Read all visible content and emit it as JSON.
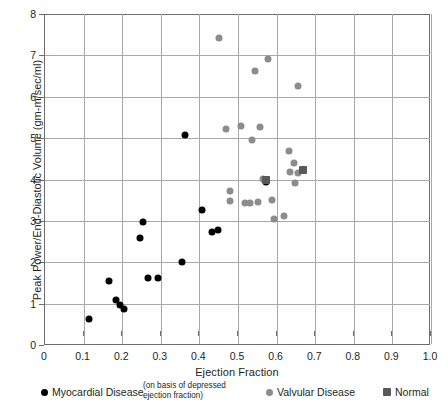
{
  "chart_data": {
    "type": "scatter",
    "title": "",
    "xlabel": "Ejection Fraction",
    "ylabel": "Peak Power/End-Diastolic Volume (gm-m/sec/ml)",
    "xlim": [
      0,
      1.0
    ],
    "ylim": [
      0,
      8
    ],
    "xticks": [
      "0",
      "0.1",
      "0.2",
      "0.3",
      "0.4",
      "0.5",
      "0.6",
      "0.7",
      "0.8",
      "0.9",
      "1.0"
    ],
    "xtick_values": [
      0,
      0.1,
      0.2,
      0.3,
      0.4,
      0.5,
      0.6,
      0.7,
      0.8,
      0.9,
      1.0
    ],
    "yticks": [
      "0",
      "1",
      "2",
      "3",
      "4",
      "5",
      "6",
      "7",
      "8"
    ],
    "ytick_values": [
      0,
      1,
      2,
      3,
      4,
      5,
      6,
      7,
      8
    ],
    "grid": true,
    "legend_position": "bottom",
    "series": [
      {
        "name": "Myocardial Disease",
        "marker": "circle",
        "color": "#000000",
        "points": [
          [
            0.115,
            0.62
          ],
          [
            0.165,
            1.55
          ],
          [
            0.185,
            1.08
          ],
          [
            0.195,
            0.97
          ],
          [
            0.205,
            0.88
          ],
          [
            0.255,
            2.97
          ],
          [
            0.245,
            2.58
          ],
          [
            0.268,
            1.63
          ],
          [
            0.292,
            1.63
          ],
          [
            0.355,
            2.0
          ],
          [
            0.362,
            5.07
          ],
          [
            0.408,
            3.27
          ],
          [
            0.432,
            2.72
          ],
          [
            0.447,
            2.77
          ],
          [
            0.572,
            3.95
          ]
        ]
      },
      {
        "name": "Valvular Disease",
        "marker": "circle",
        "color": "#8c8c8c",
        "points": [
          [
            0.45,
            7.42
          ],
          [
            0.545,
            6.62
          ],
          [
            0.578,
            6.92
          ],
          [
            0.655,
            6.25
          ],
          [
            0.47,
            5.22
          ],
          [
            0.508,
            5.3
          ],
          [
            0.535,
            4.95
          ],
          [
            0.558,
            5.27
          ],
          [
            0.632,
            4.7
          ],
          [
            0.645,
            4.4
          ],
          [
            0.635,
            4.18
          ],
          [
            0.655,
            4.15
          ],
          [
            0.648,
            3.92
          ],
          [
            0.62,
            3.12
          ],
          [
            0.48,
            3.72
          ],
          [
            0.478,
            3.47
          ],
          [
            0.518,
            3.42
          ],
          [
            0.53,
            3.42
          ],
          [
            0.552,
            3.45
          ],
          [
            0.588,
            3.5
          ],
          [
            0.592,
            3.05
          ],
          [
            0.565,
            4.02
          ]
        ]
      },
      {
        "name": "Normal",
        "marker": "square",
        "color": "#595959",
        "points": [
          [
            0.572,
            3.98
          ],
          [
            0.668,
            4.22
          ]
        ]
      }
    ]
  },
  "legend": {
    "myocardial_label": "Myocardial Disease",
    "note_line1": "(on basis of depressed",
    "note_line2": "ejection fraction)",
    "valvular_label": "Valvular Disease",
    "normal_label": "Normal"
  }
}
